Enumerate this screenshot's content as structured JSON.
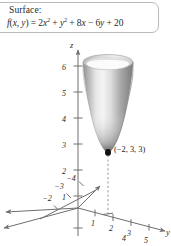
{
  "figure": {
    "caption": {
      "title": "Surface:",
      "function_prefix": "f",
      "function_args": "(x, y) = ",
      "formula_plain": "f(x, y) = 2x² + y² + 8x − 6y + 20",
      "terms": [
        {
          "coef": "2",
          "base": "x",
          "exp": "2",
          "op": ""
        },
        {
          "coef": "",
          "base": "y",
          "exp": "2",
          "op": "+"
        },
        {
          "coef": "8",
          "base": "x",
          "exp": "",
          "op": "+"
        },
        {
          "coef": "6",
          "base": "y",
          "exp": "",
          "op": "−"
        },
        {
          "coef": "20",
          "base": "",
          "exp": "",
          "op": "+"
        }
      ]
    },
    "axes": {
      "z": {
        "name": "z",
        "ticks": [
          "1",
          "2",
          "3",
          "4",
          "5",
          "6"
        ]
      },
      "y": {
        "name": "y",
        "ticks": [
          "1",
          "2",
          "3",
          "4",
          "5"
        ]
      },
      "x": {
        "name": "x",
        "ticks": [
          "−2",
          "−3",
          "−4"
        ]
      }
    },
    "annotations": {
      "vertex_label": "(−2, 3, 3)"
    },
    "colors": {
      "axis": "#6e6e6e",
      "text": "#2b2b2b",
      "surface_dark": "#7d7d7d",
      "surface_light": "#f2f2f2",
      "surface_mid": "#bdbdbd",
      "box_border": "#b9b9b9",
      "dashed": "#8a8a8a"
    }
  }
}
